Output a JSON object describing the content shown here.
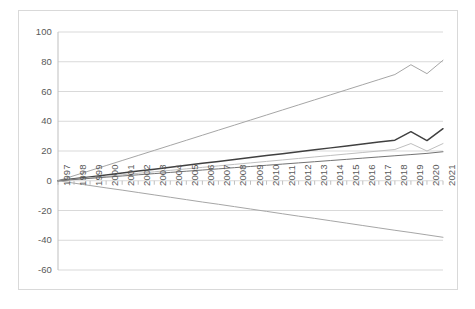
{
  "chart_data": {
    "type": "line",
    "title": "",
    "xlabel": "",
    "ylabel": "",
    "grid": true,
    "legend": "none",
    "ylim": [
      -60,
      100
    ],
    "yticks": [
      100,
      80,
      60,
      40,
      20,
      0,
      -20,
      -40,
      -60
    ],
    "categories": [
      "1997",
      "1998",
      "1999",
      "2000",
      "2001",
      "2002",
      "2003",
      "2004",
      "2005",
      "2006",
      "2007",
      "2008",
      "2009",
      "2010",
      "2011",
      "2012",
      "2013",
      "2014",
      "2015",
      "2016",
      "2017",
      "2018",
      "2019",
      "2020",
      "2021"
    ],
    "series": [
      {
        "name": "series-1",
        "color": "#a6a6a6",
        "values": [
          0,
          3.4,
          6.8,
          10.2,
          13.6,
          17,
          20.4,
          23.8,
          27.2,
          30.6,
          34,
          37.4,
          40.8,
          44.2,
          47.6,
          51,
          54.4,
          57.8,
          61.2,
          64.6,
          68,
          71.4,
          78,
          72,
          81
        ]
      },
      {
        "name": "series-2",
        "color": "#404040",
        "values": [
          0,
          1.3,
          2.6,
          3.9,
          5.2,
          6.5,
          7.8,
          9.1,
          10.4,
          11.7,
          13,
          14.3,
          15.6,
          16.9,
          18.2,
          19.5,
          20.8,
          22.1,
          23.4,
          24.7,
          26,
          27.3,
          33,
          27,
          35
        ]
      },
      {
        "name": "series-3",
        "color": "#bfbfbf",
        "values": [
          0,
          1.0,
          2.0,
          3.0,
          4.0,
          5.0,
          6.0,
          7.0,
          8.0,
          9.0,
          10.0,
          11.0,
          12.0,
          13.0,
          14.0,
          15.0,
          16.0,
          17.0,
          18.0,
          19.0,
          20.0,
          21.0,
          25,
          20,
          25
        ]
      },
      {
        "name": "series-4",
        "color": "#737373",
        "values": [
          0,
          0.8,
          1.6,
          2.4,
          3.2,
          4.0,
          4.8,
          5.6,
          6.4,
          7.2,
          8.0,
          8.8,
          9.6,
          10.4,
          11.2,
          12.0,
          12.8,
          13.6,
          14.4,
          15.2,
          16.0,
          16.8,
          17.6,
          18.4,
          19.5
        ]
      },
      {
        "name": "series-5",
        "color": "#a6a6a6",
        "values": [
          0,
          -1.6,
          -3.2,
          -4.8,
          -6.3,
          -7.9,
          -9.5,
          -11.1,
          -12.7,
          -14.3,
          -15.8,
          -17.4,
          -19.0,
          -20.6,
          -22.2,
          -23.8,
          -25.3,
          -26.9,
          -28.5,
          -30.1,
          -31.7,
          -33.3,
          -34.8,
          -36.4,
          -38.0
        ]
      }
    ]
  }
}
